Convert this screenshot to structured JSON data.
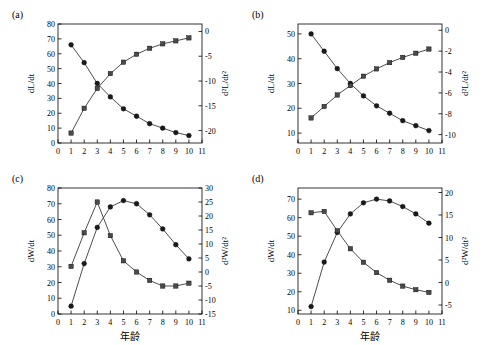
{
  "figure": {
    "xlabel_common": "年龄",
    "background": "#ffffff",
    "line_color": "#3a3a3a",
    "marker_circle_color": "#1a1a1a",
    "marker_square_color": "#4a4a4a"
  },
  "panels": [
    {
      "label": "(a)",
      "ylabel_left": "dL/dt",
      "ylabel_right": "d²L/dt²",
      "xlabel": "",
      "x": [
        1,
        2,
        3,
        4,
        5,
        6,
        7,
        8,
        9,
        10
      ],
      "xticks": [
        0,
        1,
        2,
        3,
        4,
        5,
        6,
        7,
        8,
        9,
        10,
        11
      ],
      "xlim": [
        0,
        11
      ],
      "left_ticks": [
        0,
        10,
        20,
        30,
        40,
        50,
        60,
        70,
        80
      ],
      "left_lim": [
        0,
        80
      ],
      "right_ticks": [
        0,
        -5,
        -10,
        -15,
        -20
      ],
      "right_lim": [
        -22.5,
        1.5
      ],
      "series": [
        {
          "name": "dL/dt",
          "marker": "circle",
          "axis": "left",
          "values": [
            66,
            54,
            40,
            31,
            23,
            18,
            13,
            10,
            7,
            5
          ]
        },
        {
          "name": "d²L/dt²",
          "marker": "square",
          "axis": "right",
          "values": [
            -20.5,
            -15.5,
            -11.5,
            -8.5,
            -6.2,
            -4.6,
            -3.4,
            -2.5,
            -1.9,
            -1.3
          ]
        }
      ]
    },
    {
      "label": "(b)",
      "ylabel_left": "dL/dt",
      "ylabel_right": "d²L/dt²",
      "xlabel": "",
      "x": [
        1,
        2,
        3,
        4,
        5,
        6,
        7,
        8,
        9,
        10
      ],
      "xticks": [
        0,
        1,
        2,
        3,
        4,
        5,
        6,
        7,
        8,
        9,
        10,
        11
      ],
      "xlim": [
        0,
        11
      ],
      "left_ticks": [
        10,
        20,
        30,
        40,
        50
      ],
      "left_lim": [
        6,
        54
      ],
      "right_ticks": [
        0,
        -2,
        -4,
        -6,
        -8,
        -10
      ],
      "right_lim": [
        -10.8,
        0.6
      ],
      "series": [
        {
          "name": "dL/dt",
          "marker": "circle",
          "axis": "left",
          "values": [
            50,
            43,
            36,
            30,
            25,
            21,
            18,
            15,
            13,
            11
          ]
        },
        {
          "name": "d²L/dt²",
          "marker": "square",
          "axis": "right",
          "values": [
            -8.4,
            -7.3,
            -6.2,
            -5.3,
            -4.4,
            -3.7,
            -3.1,
            -2.6,
            -2.2,
            -1.8
          ]
        }
      ]
    },
    {
      "label": "(c)",
      "ylabel_left": "dW/dt",
      "ylabel_right": "d²W/dt²",
      "xlabel": "年龄",
      "x": [
        1,
        2,
        3,
        4,
        5,
        6,
        7,
        8,
        9,
        10
      ],
      "xticks": [
        0,
        1,
        2,
        3,
        4,
        5,
        6,
        7,
        8,
        9,
        10,
        11
      ],
      "xlim": [
        0,
        11
      ],
      "left_ticks": [
        0,
        10,
        20,
        30,
        40,
        50,
        60,
        70,
        80
      ],
      "left_lim": [
        0,
        80
      ],
      "right_ticks": [
        -15,
        -10,
        -5,
        0,
        5,
        10,
        15,
        20,
        25,
        30
      ],
      "right_lim": [
        -15,
        30
      ],
      "series": [
        {
          "name": "dW/dt",
          "marker": "circle",
          "axis": "left",
          "values": [
            5,
            32,
            55,
            68,
            72,
            70,
            63,
            54,
            44,
            35
          ]
        },
        {
          "name": "d²W/dt²",
          "marker": "square",
          "axis": "right",
          "values": [
            2,
            14,
            25,
            13,
            4,
            0,
            -3,
            -5,
            -5,
            -4
          ]
        }
      ]
    },
    {
      "label": "(d)",
      "ylabel_left": "dW/dt",
      "ylabel_right": "d²W/dt²",
      "xlabel": "年龄",
      "x": [
        1,
        2,
        3,
        4,
        5,
        6,
        7,
        8,
        9,
        10
      ],
      "xticks": [
        0,
        1,
        2,
        3,
        4,
        5,
        6,
        7,
        8,
        9,
        10,
        11
      ],
      "xlim": [
        0,
        11
      ],
      "left_ticks": [
        10,
        20,
        30,
        40,
        50,
        60,
        70
      ],
      "left_lim": [
        8,
        76
      ],
      "right_ticks": [
        -5,
        0,
        5,
        10,
        15,
        20
      ],
      "right_lim": [
        -7,
        21
      ],
      "series": [
        {
          "name": "dW/dt",
          "marker": "circle",
          "axis": "left",
          "values": [
            12,
            36,
            52,
            62,
            68,
            70,
            69,
            66,
            62,
            57
          ]
        },
        {
          "name": "d²W/dt²",
          "marker": "square",
          "axis": "right",
          "values": [
            15.5,
            15.8,
            11.5,
            7.5,
            4.5,
            2.2,
            0.5,
            -0.8,
            -1.6,
            -2.2
          ]
        }
      ]
    }
  ]
}
